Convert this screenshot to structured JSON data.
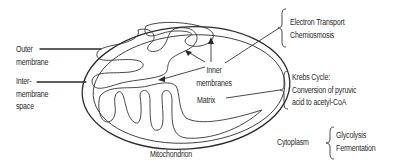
{
  "diagram": {
    "title": "Mitochondrion",
    "left_labels": {
      "outer_membrane": [
        "Outer",
        "membrane"
      ],
      "intermembrane_space": [
        "Inter-",
        "membrane",
        "space"
      ]
    },
    "inner_labels": {
      "inner_membranes": [
        "Inner",
        "membranes"
      ],
      "matrix": "Matrix"
    },
    "right_groups": [
      {
        "name": "inner-membrane-processes",
        "lines": [
          "Electron Transport",
          "Chemiosmosis"
        ]
      },
      {
        "name": "matrix-processes",
        "lines": [
          "Krebs Cycle:",
          "Conversion of pyruvic",
          "acid to acetyl-CoA"
        ]
      }
    ],
    "cytoplasm": {
      "label": "Cytoplasm",
      "lines": [
        "Glycolysis",
        "Fermentation"
      ]
    }
  }
}
